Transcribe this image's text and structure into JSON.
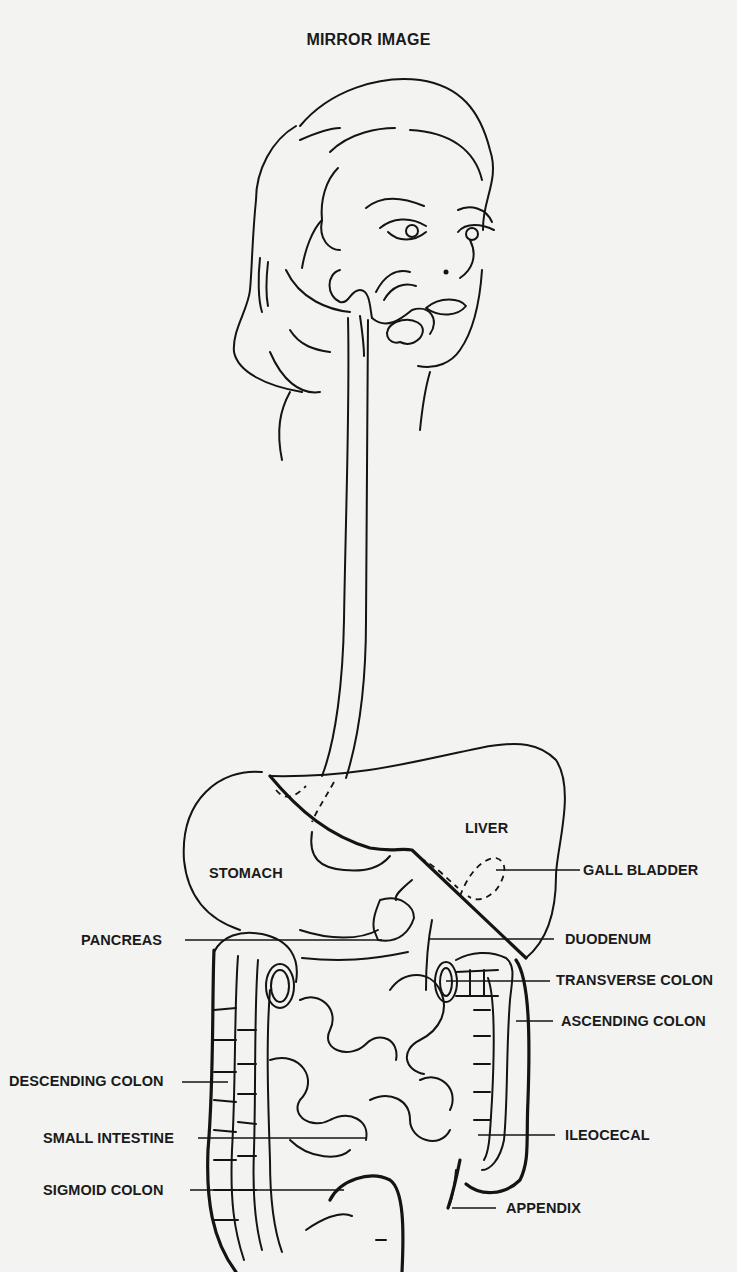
{
  "title": "MIRROR IMAGE",
  "labels": {
    "liver": "LIVER",
    "stomach": "STOMACH",
    "gall_bladder": "GALL BLADDER",
    "pancreas": "PANCREAS",
    "duodenum": "DUODENUM",
    "transverse_colon": "TRANSVERSE COLON",
    "ascending_colon": "ASCENDING COLON",
    "descending_colon": "DESCENDING COLON",
    "small_intestine": "SMALL INTESTINE",
    "ileocecal": "ILEOCECAL",
    "sigmoid_colon": "SIGMOID COLON",
    "appendix": "APPENDIX"
  },
  "colors": {
    "background": "#f3f3f1",
    "ink": "#141414"
  }
}
